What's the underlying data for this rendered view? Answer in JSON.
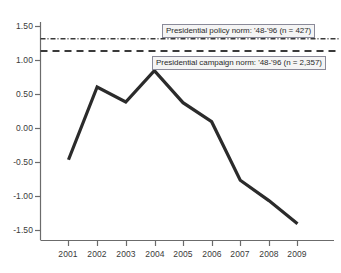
{
  "chart_data": {
    "type": "line",
    "title": "",
    "xlabel": "",
    "ylabel": "",
    "x": [
      "2001",
      "2002",
      "2003",
      "2004",
      "2005",
      "2006",
      "2007",
      "2008",
      "2009"
    ],
    "categories": [
      "2001",
      "2002",
      "2003",
      "2004",
      "2005",
      "2006",
      "2007",
      "2008",
      "2009"
    ],
    "series": [
      {
        "name": "annual value",
        "values": [
          -0.46,
          0.61,
          0.39,
          0.85,
          0.38,
          0.1,
          -0.76,
          -1.06,
          -1.4
        ]
      }
    ],
    "reference_lines": [
      {
        "name": "presidential-policy-norm",
        "label": "Presidential policy norm: '48-'96 (n = 427)",
        "value": 1.32,
        "style": "dash-dot"
      },
      {
        "name": "presidential-campaign-norm",
        "label": "Presidential campaign norm: '48-'96 (n = 2,357)",
        "value": 1.14,
        "style": "dashed"
      }
    ],
    "ylim": [
      -1.62,
      1.62
    ],
    "yticks": [
      "1.50",
      "1.00",
      "0.50",
      "0.00",
      "-0.50",
      "-1.00",
      "-1.50"
    ],
    "ytick_values": [
      1.5,
      1.0,
      0.5,
      0.0,
      -0.5,
      -1.0,
      -1.5
    ],
    "xticks": [
      "2001",
      "2002",
      "2003",
      "2004",
      "2005",
      "2006",
      "2007",
      "2008",
      "2009"
    ],
    "grid": false,
    "legend": "none",
    "colors": {
      "line": "#2b2b2b",
      "axis": "#6b6b6b",
      "reference_line": "#3a3a3a",
      "label_background": "#f4f4f4",
      "label_border": "#8a8a99",
      "background": "#ffffff"
    }
  },
  "axes": {
    "y_labels": [
      "1.50",
      "1.00",
      "0.50",
      "0.00",
      "-0.50",
      "-1.00",
      "-1.50"
    ],
    "x_labels": [
      "2001",
      "2002",
      "2003",
      "2004",
      "2005",
      "2006",
      "2007",
      "2008",
      "2009"
    ]
  },
  "annotations": {
    "policy_norm_label": "Presidential policy norm: '48-'96 (n = 427)",
    "campaign_norm_label": "Presidential campaign norm: '48-'96 (n = 2,357)"
  }
}
